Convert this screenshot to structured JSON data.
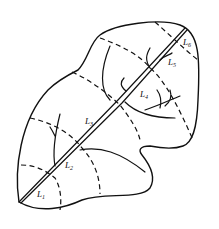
{
  "diagram": {
    "type": "leaf segmentation sketch",
    "stroke_color": "#111111",
    "background": "#ffffff",
    "labels": [
      {
        "id": "L1",
        "text": "L",
        "sub": "1",
        "x": 37,
        "y": 197
      },
      {
        "id": "L2",
        "text": "L",
        "sub": "2",
        "x": 65,
        "y": 168
      },
      {
        "id": "L3",
        "text": "L",
        "sub": "3",
        "x": 85,
        "y": 124
      },
      {
        "id": "L4",
        "text": "L",
        "sub": "4",
        "x": 140,
        "y": 97
      },
      {
        "id": "L5",
        "text": "L",
        "sub": "5",
        "x": 168,
        "y": 65
      },
      {
        "id": "L6",
        "text": "L",
        "sub": "6",
        "x": 183,
        "y": 45
      }
    ]
  }
}
